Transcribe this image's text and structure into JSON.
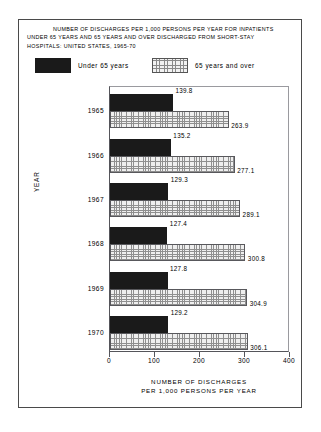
{
  "title": {
    "line1": "NUMBER OF DISCHARGES PER 1,000 PERSONS PER YEAR FOR INPATIENTS",
    "line2": "UNDER 65 YEARS AND 65 YEARS AND OVER DISCHARGED FROM  SHORT-STAY",
    "line3": "HOSPITALS: UNITED STATES, 1965-70"
  },
  "legend": {
    "under_label": "Under 65 years",
    "over_label": "65 years and over",
    "under_swatch": "black-solid-swatch",
    "over_swatch": "dotted-pattern-swatch"
  },
  "axes": {
    "ylabel": "YEAR",
    "xlabel_line1": "NUMBER  OF  DISCHARGES",
    "xlabel_line2": "PER 1,000 PERSONS PER  YEAR",
    "xticks": [
      "0",
      "100",
      "200",
      "300",
      "400"
    ]
  },
  "chart_data": {
    "type": "bar",
    "orientation": "horizontal",
    "title": "NUMBER OF DISCHARGES PER 1,000 PERSONS PER YEAR FOR INPATIENTS UNDER 65 YEARS AND 65 YEARS AND OVER DISCHARGED FROM SHORT-STAY HOSPITALS: UNITED STATES, 1965-70",
    "xlabel": "NUMBER OF DISCHARGES PER 1,000 PERSONS PER YEAR",
    "ylabel": "YEAR",
    "categories": [
      "1965",
      "1966",
      "1967",
      "1968",
      "1969",
      "1970"
    ],
    "series": [
      {
        "name": "Under 65 years",
        "color": "#1a1a1a",
        "values": [
          139.8,
          135.2,
          129.3,
          127.4,
          127.8,
          129.2
        ],
        "labels": [
          "139.8",
          "135.2",
          "129.3",
          "127.4",
          "127.8",
          "129.2"
        ]
      },
      {
        "name": "65 years and over",
        "color": "#efefef",
        "values": [
          263.9,
          277.1,
          289.1,
          300.8,
          304.9,
          306.1
        ],
        "labels": [
          "263.9",
          "277.1",
          "289.1",
          "300.8",
          "304.9",
          "306.1"
        ]
      }
    ],
    "xlim": [
      0,
      400
    ],
    "xticks": [
      0,
      100,
      200,
      300,
      400
    ],
    "grid": false,
    "legend_position": "top"
  }
}
